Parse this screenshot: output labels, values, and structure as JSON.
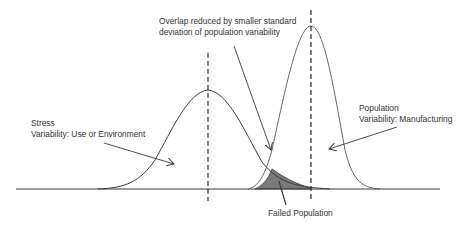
{
  "diagram": {
    "type": "stress-strength interference",
    "colors": {
      "line": "#3a3a3a",
      "dashed": "#2a2a2a",
      "fill": "#7a7a7a",
      "text": "#333333",
      "background": "#ffffff"
    },
    "labels": {
      "overlap_line1": "Overlap reduced by smaller standard",
      "overlap_line2": "deviation of population variability",
      "stress_line1": "Stress",
      "stress_line2": "Variability: Use or Environment",
      "population_line1": "Population",
      "population_line2": "Variability: Manufacturing",
      "failed": "Failed Population"
    },
    "curves": [
      {
        "name": "Stress",
        "mean_x": 208,
        "peak_y": 90,
        "spread": "wide"
      },
      {
        "name": "Population",
        "mean_x": 311,
        "peak_y": 26,
        "spread": "narrow"
      }
    ]
  }
}
